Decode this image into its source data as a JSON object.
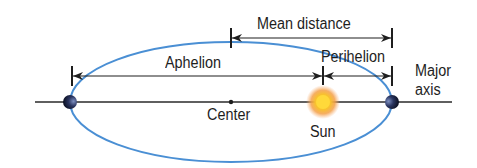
{
  "diagram": {
    "labels": {
      "mean_distance": "Mean distance",
      "aphelion": "Aphelion",
      "perihelion": "Perihelion",
      "major_axis_line1": "Major",
      "major_axis_line2": "axis",
      "center": "Center",
      "sun": "Sun"
    },
    "colors": {
      "orbit": "#4a8fd4",
      "lines": "#1e1e1e",
      "sun_core": "#f7c42a",
      "sun_glow": "#f4a64a",
      "planet": "#1b2340"
    }
  }
}
